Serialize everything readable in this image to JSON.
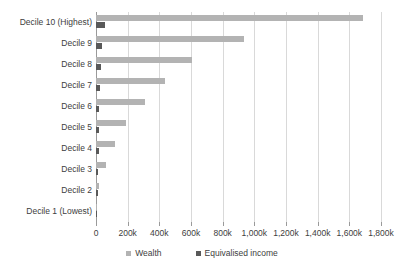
{
  "chart_data": {
    "type": "bar",
    "orientation": "horizontal",
    "title": "",
    "subtitle": "",
    "xlabel": "",
    "ylabel": "",
    "xlim": [
      0,
      1800000
    ],
    "grid": true,
    "legend_position": "bottom",
    "categories": [
      "Decile 10 (Highest)",
      "Decile 9",
      "Decile 8",
      "Decile 7",
      "Decile 6",
      "Decile 5",
      "Decile 4",
      "Decile 3",
      "Decile 2",
      "Decile 1 (Lowest)"
    ],
    "series": [
      {
        "name": "Wealth",
        "color": "#b3b3b3",
        "values": [
          1685000,
          934000,
          606000,
          435000,
          309000,
          189000,
          120000,
          63000,
          19000,
          2000
        ]
      },
      {
        "name": "Equivalised income",
        "color": "#595959",
        "values": [
          57000,
          38000,
          31000,
          26000,
          22000,
          19000,
          16000,
          13000,
          10000,
          6000
        ]
      }
    ],
    "xticks": [
      0,
      200000,
      400000,
      600000,
      800000,
      1000000,
      1200000,
      1400000,
      1600000,
      1800000
    ],
    "xticklabels": [
      "0",
      "200k",
      "400k",
      "600k",
      "800k",
      "1,000k",
      "1,200k",
      "1,400k",
      "1,600k",
      "1,800k"
    ]
  },
  "legend": {
    "items": [
      {
        "label": "Wealth",
        "color": "#b3b3b3"
      },
      {
        "label": "Equivalised income",
        "color": "#595959"
      }
    ]
  },
  "colors": {
    "wealth": "#b3b3b3",
    "income": "#595959",
    "gridline": "#d9d9d9",
    "axis": "#9a9a9a",
    "text": "#404040",
    "background": "#ffffff"
  }
}
